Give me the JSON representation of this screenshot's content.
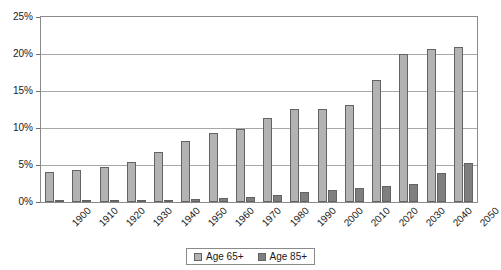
{
  "chart_data": {
    "type": "bar",
    "title": "",
    "subtitle": "",
    "xlabel": "",
    "ylabel": "",
    "ylim": [
      0,
      25
    ],
    "ytick_labels": [
      "0%",
      "5%",
      "10%",
      "15%",
      "20%",
      "25%"
    ],
    "ytick_values": [
      0,
      5,
      10,
      15,
      20,
      25
    ],
    "grid": "horizontal",
    "legend_position": "bottom-center",
    "categories": [
      "1900",
      "1910",
      "1920",
      "1930",
      "1940",
      "1950",
      "1960",
      "1970",
      "1980",
      "1990",
      "2000",
      "2010",
      "2020",
      "2030",
      "2040",
      "2050"
    ],
    "series": [
      {
        "name": "Age 65+",
        "color": "#b3b3b3",
        "values": [
          4.1,
          4.3,
          4.7,
          5.4,
          6.8,
          8.2,
          9.3,
          9.9,
          11.4,
          12.6,
          12.6,
          13.1,
          16.5,
          20.0,
          20.7,
          21.0
        ]
      },
      {
        "name": "Age 85+",
        "color": "#7f7f7f",
        "values": [
          0.2,
          0.2,
          0.2,
          0.3,
          0.3,
          0.4,
          0.5,
          0.7,
          1.0,
          1.3,
          1.6,
          1.9,
          2.1,
          2.4,
          3.9,
          5.3
        ]
      }
    ]
  }
}
